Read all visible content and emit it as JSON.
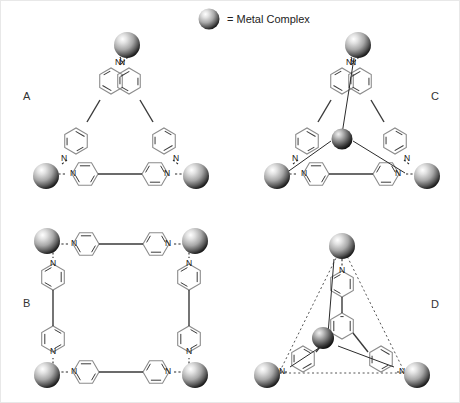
{
  "figure": {
    "background_color": "#ffffff",
    "legend": {
      "marker": "metal-complex-sphere",
      "text": "= Metal Complex"
    },
    "panels": [
      {
        "id": "A",
        "label": "A",
        "shape": "triangle",
        "description": "Trinuclear triangular macrocycle of three 4,4'-bipyridine edges bridging three metal complexes",
        "metal_count": 3,
        "ligand": "4,4'-bipyridine",
        "ligand_count": 3,
        "nitrogen_labels": [
          "N",
          "N",
          "N",
          "N",
          "N",
          "N"
        ],
        "central_metal": false,
        "dotted_outline": false
      },
      {
        "id": "B",
        "label": "B",
        "shape": "square",
        "description": "Tetranuclear square macrocycle of four 4,4'-bipyridine edges bridging four metal complexes",
        "metal_count": 4,
        "ligand": "4,4'-bipyridine",
        "ligand_count": 4,
        "nitrogen_labels": [
          "N",
          "N",
          "N",
          "N",
          "N",
          "N",
          "N",
          "N"
        ],
        "central_metal": false,
        "dotted_outline": false
      },
      {
        "id": "C",
        "label": "C",
        "shape": "triangle",
        "description": "Triangular macrocycle as in A with an additional central metal complex bonded to the three vertex metals",
        "metal_count": 4,
        "ligand": "4,4'-bipyridine",
        "ligand_count": 3,
        "nitrogen_labels": [
          "N",
          "N",
          "N",
          "N",
          "N",
          "N"
        ],
        "central_metal": true,
        "dotted_outline": false
      },
      {
        "id": "D",
        "label": "D",
        "shape": "triangle",
        "description": "Tripodal 1,3,5-tri(4-pyridyl)benzene ligand with a central metal complex and three peripheral metal complexes, dotted triangle guide",
        "metal_count": 4,
        "ligand": "1,3,5-tri(4-pyridyl)benzene",
        "ligand_count": 1,
        "nitrogen_labels": [
          "N",
          "N",
          "N"
        ],
        "central_metal": true,
        "dotted_outline": true
      }
    ],
    "colors": {
      "sphere_light": "#f2f2f2",
      "sphere_mid": "#9a9a9a",
      "sphere_dark": "#2b2b2b",
      "ring_stroke": "#8c8c8c",
      "bond_stroke": "#2b2b2b",
      "text": "#333333"
    }
  }
}
